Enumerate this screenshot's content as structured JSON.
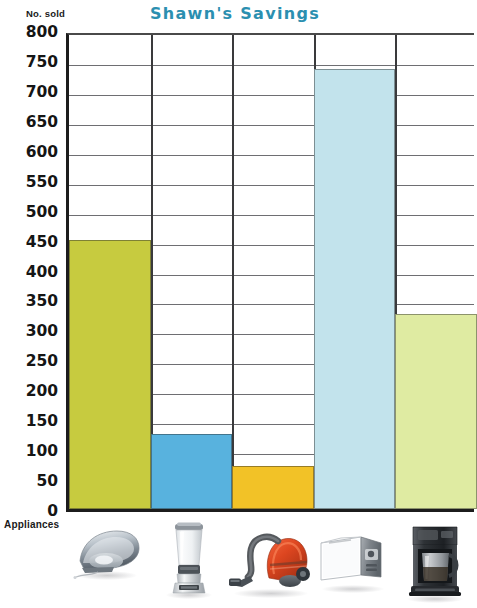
{
  "chart_data": {
    "type": "bar",
    "title": "Shawn's Savings",
    "xlabel": "Appliances",
    "ylabel": "No. sold",
    "categories": [
      "iron",
      "blender",
      "vacuum cleaner",
      "toaster",
      "coffee maker"
    ],
    "values": [
      450,
      125,
      72,
      735,
      325
    ],
    "ylim": [
      0,
      800
    ],
    "ytick_step": 50,
    "yticks": [
      800,
      750,
      700,
      650,
      600,
      550,
      500,
      450,
      400,
      350,
      300,
      250,
      200,
      150,
      100,
      50,
      0
    ],
    "ytick_labels": [
      "800",
      "750",
      "700",
      "650",
      "600",
      "550",
      "500",
      "450",
      "400",
      "350",
      "300",
      "250",
      "200",
      "150",
      "100",
      "50",
      "0"
    ],
    "grid": true,
    "grid_axis": "both",
    "legend": false,
    "bar_colors": [
      "#c7cb3f",
      "#58b2de",
      "#f2c227",
      "#c2e3ec",
      "#dfeba2"
    ]
  },
  "header": {
    "title": "Shawn's Savings",
    "title_color": "#2b8fb0"
  },
  "axes": {
    "y_axis_caption": "No. sold",
    "x_axis_caption": "Appliances",
    "y_tick_labels": [
      "800",
      "750",
      "700",
      "650",
      "600",
      "550",
      "500",
      "450",
      "400",
      "350",
      "300",
      "250",
      "200",
      "150",
      "100",
      "50",
      "0"
    ]
  },
  "bars": [
    {
      "category": "iron",
      "value": 450,
      "color": "#c7cb3f",
      "icon": "iron-icon"
    },
    {
      "category": "blender",
      "value": 125,
      "color": "#58b2de",
      "icon": "blender-icon"
    },
    {
      "category": "vacuum cleaner",
      "value": 72,
      "color": "#f2c227",
      "icon": "vacuum-cleaner-icon"
    },
    {
      "category": "toaster",
      "value": 735,
      "color": "#c2e3ec",
      "icon": "toaster-icon"
    },
    {
      "category": "coffee maker",
      "value": 325,
      "color": "#dfeba2",
      "icon": "coffee-maker-icon"
    }
  ]
}
